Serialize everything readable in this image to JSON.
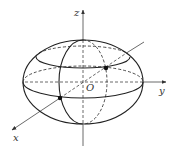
{
  "diagram": {
    "type": "ellipsoid-3d-axes",
    "labels": {
      "z_axis": "z",
      "y_axis": "y",
      "x_axis": "x",
      "origin": "O"
    },
    "colors": {
      "stroke": "#222222",
      "axis": "#444444",
      "background": "#ffffff"
    },
    "points": [
      {
        "name": "point-upper-right",
        "cx": 106,
        "cy": 68
      },
      {
        "name": "point-lower-left",
        "cx": 60,
        "cy": 98
      }
    ]
  }
}
